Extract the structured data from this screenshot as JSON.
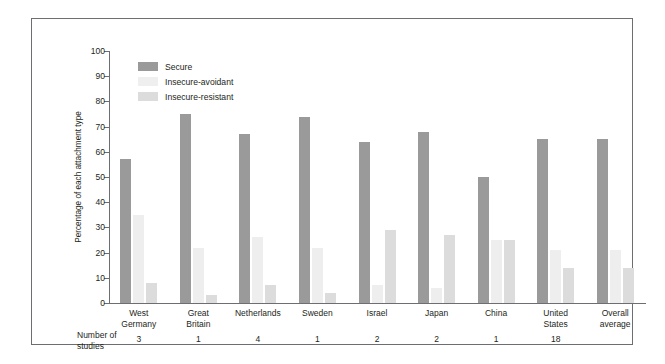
{
  "chart_data": {
    "type": "bar",
    "title": "",
    "xlabel": "",
    "ylabel": "Percentage of each attachment type",
    "ylim": [
      0,
      100
    ],
    "ytick_step": 10,
    "yticks": [
      0,
      10,
      20,
      30,
      40,
      50,
      60,
      70,
      80,
      90,
      100
    ],
    "grid": false,
    "legend_position": "top-left",
    "categories": [
      "West Germany",
      "Great Britain",
      "Netherlands",
      "Sweden",
      "Israel",
      "Japan",
      "China",
      "United States",
      "Overall average"
    ],
    "category_lines": [
      [
        "West",
        "Germany"
      ],
      [
        "Great",
        "Britain"
      ],
      [
        "Netherlands"
      ],
      [
        "Sweden"
      ],
      [
        "Israel"
      ],
      [
        "Japan"
      ],
      [
        "China"
      ],
      [
        "United",
        "States"
      ],
      [
        "Overall",
        "average"
      ]
    ],
    "series": [
      {
        "name": "Secure",
        "color": "#9a9a9a",
        "values": [
          57,
          75,
          67,
          74,
          64,
          68,
          50,
          65,
          65
        ]
      },
      {
        "name": "Insecure-avoidant",
        "color": "#eeeeee",
        "values": [
          35,
          22,
          26,
          22,
          7,
          6,
          25,
          21,
          21
        ]
      },
      {
        "name": "Insecure-resistant",
        "color": "#dcdcdc",
        "values": [
          8,
          3,
          7,
          4,
          29,
          27,
          25,
          14,
          14
        ]
      }
    ],
    "number_of_studies_label": [
      "Number of",
      "studies"
    ],
    "number_of_studies": [
      "3",
      "1",
      "4",
      "1",
      "2",
      "2",
      "1",
      "18",
      ""
    ]
  },
  "legend": {
    "items": [
      {
        "label": "Secure",
        "swatch": "legend-swatch-secure"
      },
      {
        "label": "Insecure-avoidant",
        "swatch": "legend-swatch-insecure-avoidant"
      },
      {
        "label": "Insecure-resistant",
        "swatch": "legend-swatch-insecure-resistant"
      }
    ]
  },
  "colors": {
    "secure": "#9a9a9a",
    "insecure_avoidant": "#eeeeee",
    "insecure_resistant": "#dcdcdc",
    "axis": "#6d6e71",
    "border": "#6d6e71",
    "text": "#231f20",
    "background": "#ffffff"
  }
}
